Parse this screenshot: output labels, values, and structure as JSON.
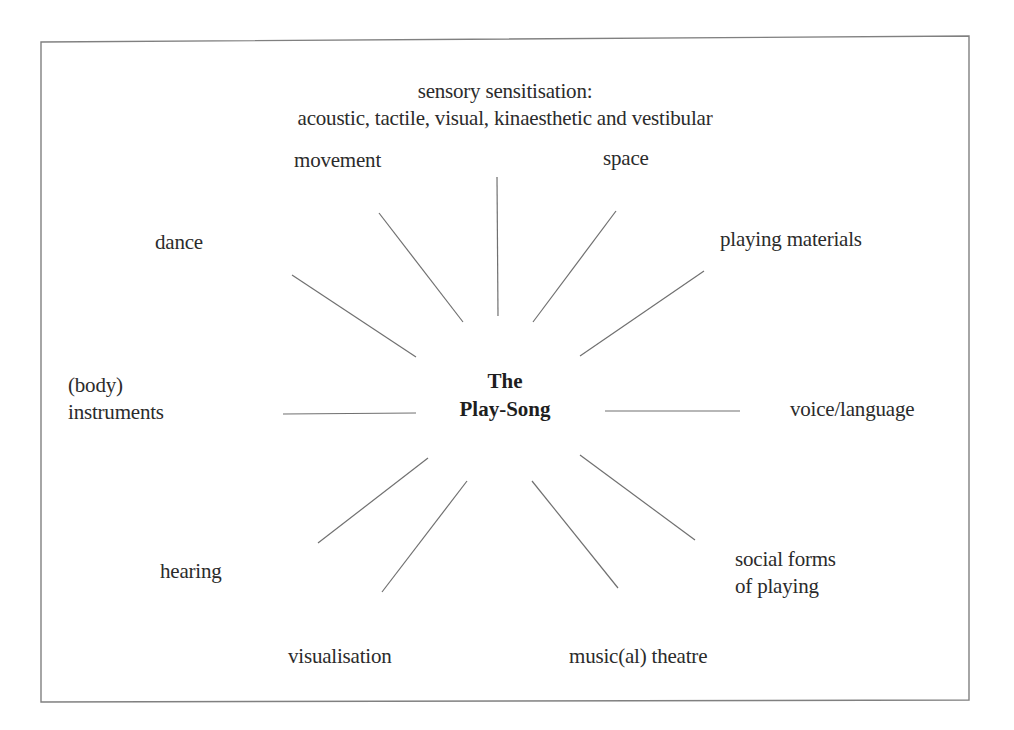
{
  "diagram": {
    "center": {
      "line1": "The",
      "line2": "Play-Song"
    },
    "header": {
      "line1": "sensory sensitisation:",
      "line2": "acoustic, tactile, visual, kinaesthetic and vestibular"
    },
    "nodes": {
      "movement": "movement",
      "space": "space",
      "dance": "dance",
      "playing_materials": "playing materials",
      "body_instruments_line1": "(body)",
      "body_instruments_line2": "instruments",
      "voice_language": "voice/language",
      "hearing": "hearing",
      "social_forms_line1": "social forms",
      "social_forms_line2": "of playing",
      "visualisation": "visualisation",
      "musical_theatre": "music(al) theatre"
    },
    "colors": {
      "line": "#6e6e6e",
      "border": "#7a7a7a",
      "text": "#2b2b2b"
    }
  }
}
